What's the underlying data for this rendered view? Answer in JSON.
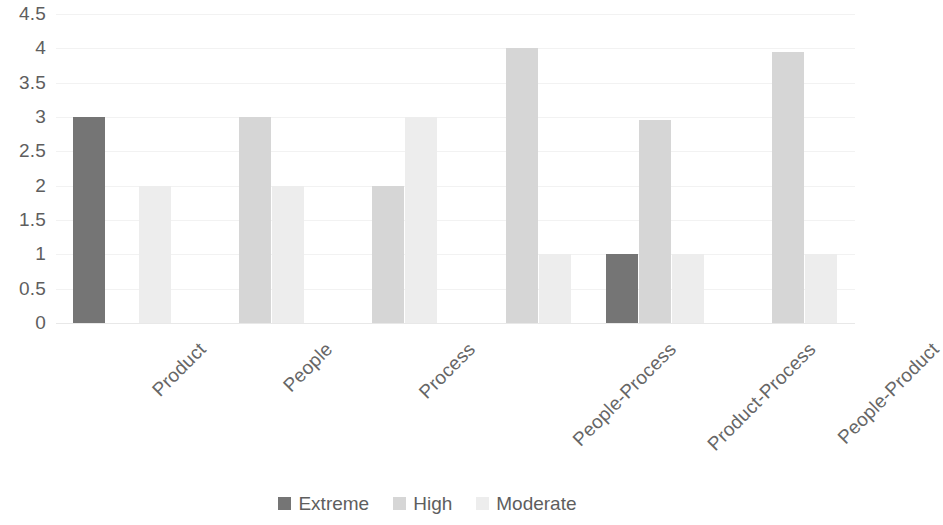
{
  "chart_data": {
    "type": "bar",
    "title": "",
    "subtitle": "",
    "xlabel": "",
    "ylabel": "",
    "ylim": [
      0,
      4.5
    ],
    "y_ticks": [
      "4.5",
      "4",
      "3.5",
      "3",
      "2.5",
      "2",
      "1.5",
      "1",
      "0.5",
      "0"
    ],
    "y_tick_values": [
      4.5,
      4,
      3.5,
      3,
      2.5,
      2,
      1.5,
      1,
      0.5,
      0
    ],
    "grid": true,
    "grid_axis": "y",
    "legend_position": "bottom-center",
    "x_label_rotation": -45,
    "categories": [
      "Product",
      "People",
      "Process",
      "People-Process",
      "Product-Process",
      "People-Product"
    ],
    "series": [
      {
        "name": "Extreme",
        "color": "#757575",
        "values": [
          3,
          0,
          0,
          0,
          1,
          0
        ]
      },
      {
        "name": "High",
        "color": "#d6d6d6",
        "values": [
          0,
          3,
          2,
          4,
          2.95,
          3.95
        ]
      },
      {
        "name": "Moderate",
        "color": "#ededed",
        "values": [
          2,
          2,
          3,
          1,
          1,
          1
        ]
      }
    ]
  },
  "legend": {
    "items": [
      {
        "label": "Extreme",
        "swatch": "extreme"
      },
      {
        "label": "High",
        "swatch": "high"
      },
      {
        "label": "Moderate",
        "swatch": "moderate"
      }
    ]
  },
  "colors": {
    "extreme": "#757575",
    "high": "#d6d6d6",
    "moderate": "#ededed",
    "gridline": "#f2f2f2",
    "axis_text": "#5e5e5e"
  }
}
